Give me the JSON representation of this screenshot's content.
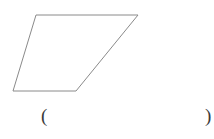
{
  "canvas": {
    "width": 214,
    "height": 139,
    "background_color": "#ffffff"
  },
  "figure": {
    "name": "parallelogram",
    "shape_type": "quadrilateral",
    "stroke_color": "#8a8a8a",
    "stroke_width": 1,
    "fill_color": "none",
    "vertices": [
      {
        "label": "top-left",
        "x": 36,
        "y": 15
      },
      {
        "label": "top-right",
        "x": 138,
        "y": 15
      },
      {
        "label": "bottom-right",
        "x": 76,
        "y": 91
      },
      {
        "label": "bottom-left",
        "x": 13,
        "y": 91
      }
    ],
    "points_path": "36,15 138,15 76,91 13,91"
  },
  "answer": {
    "open_paren": "(",
    "close_paren": ")",
    "value": ""
  }
}
